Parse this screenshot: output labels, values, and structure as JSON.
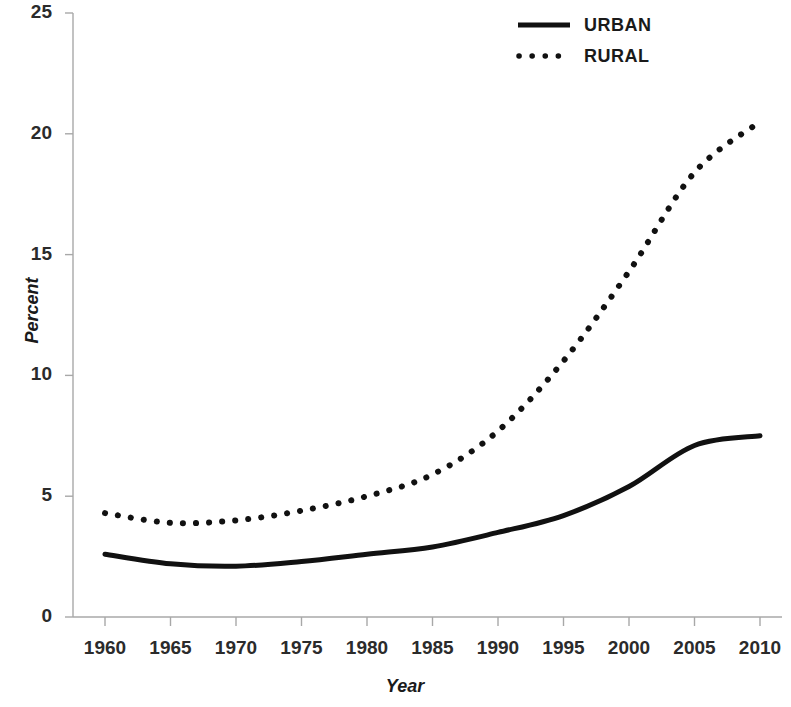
{
  "chart_data": {
    "type": "line",
    "title": "",
    "xlabel": "Year",
    "ylabel": "Percent",
    "x": [
      1960,
      1965,
      1970,
      1975,
      1980,
      1985,
      1990,
      1995,
      2000,
      2005,
      2010
    ],
    "xtick_labels": [
      "1960",
      "1965",
      "1970",
      "1975",
      "1980",
      "1985",
      "1990",
      "1995",
      "2000",
      "2005",
      "2010"
    ],
    "ytick_labels": [
      "0",
      "5",
      "10",
      "15",
      "20",
      "25"
    ],
    "yticks": [
      0,
      5,
      10,
      15,
      20,
      25
    ],
    "xlim": [
      1960,
      2010
    ],
    "ylim": [
      0,
      25
    ],
    "grid": false,
    "legend_position": "top-right",
    "series": [
      {
        "name": "URBAN",
        "style": "solid",
        "color": "#111111",
        "values": [
          2.6,
          2.2,
          2.1,
          2.3,
          2.6,
          2.9,
          3.5,
          4.2,
          5.4,
          7.1,
          7.5
        ]
      },
      {
        "name": "RURAL",
        "style": "dotted",
        "color": "#111111",
        "values": [
          4.3,
          3.9,
          4.0,
          4.4,
          5.0,
          5.9,
          7.7,
          10.6,
          14.3,
          18.4,
          20.5
        ]
      }
    ]
  },
  "legend": {
    "items": [
      {
        "label": "URBAN",
        "style": "solid"
      },
      {
        "label": "RURAL",
        "style": "dotted"
      }
    ]
  },
  "colors": {
    "line": "#111111",
    "axis": "#8c8c8c",
    "text": "#1a1a1a",
    "background": "#ffffff"
  }
}
